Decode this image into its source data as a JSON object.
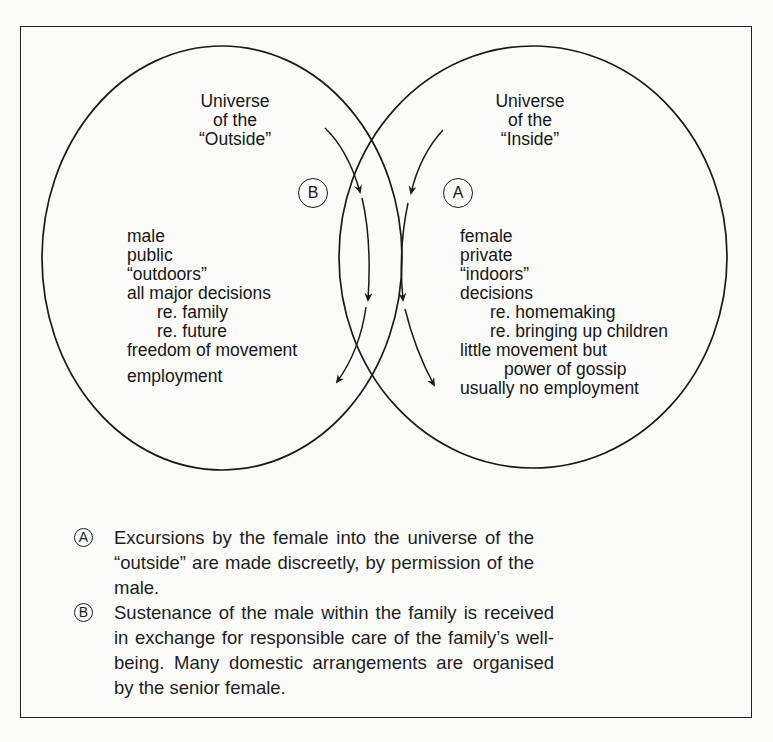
{
  "diagram": {
    "left_universe": {
      "title_lines": [
        "Universe",
        "of the",
        "“Outside”"
      ],
      "badge": "B",
      "items": [
        {
          "text": "male",
          "level": 0
        },
        {
          "text": "public",
          "level": 0
        },
        {
          "text": "“outdoors”",
          "level": 0
        },
        {
          "text": "all major decisions",
          "level": 0
        },
        {
          "text": "re. family",
          "level": 1
        },
        {
          "text": "re. future",
          "level": 1
        },
        {
          "text": "freedom of movement",
          "level": 0
        },
        {
          "text": "employment",
          "level": 0
        }
      ]
    },
    "right_universe": {
      "title_lines": [
        "Universe",
        "of the",
        "“Inside”"
      ],
      "badge": "A",
      "items": [
        {
          "text": "female",
          "level": 0
        },
        {
          "text": "private",
          "level": 0
        },
        {
          "text": "“indoors”",
          "level": 0
        },
        {
          "text": "decisions",
          "level": 0
        },
        {
          "text": "re. homemaking",
          "level": 1
        },
        {
          "text": "re. bringing up children",
          "level": 1
        },
        {
          "text": "little movement but",
          "level": 0
        },
        {
          "text": "power of gossip",
          "level": 2
        },
        {
          "text": "usually no employment",
          "level": 0
        }
      ]
    },
    "arrows": [
      {
        "id": "B-excursion",
        "direction": "from outside into inside, then back",
        "count": 2
      },
      {
        "id": "A-excursion",
        "direction": "from inside into outside, then back",
        "count": 2
      }
    ],
    "line_color": "#1a1a1a",
    "background": "#fbfbf9"
  },
  "legend": [
    {
      "marker": "A",
      "text": "Excursions by the female into the universe of the “outside” are made discreetly, by permission of the male."
    },
    {
      "marker": "B",
      "text": "Sustenance of the male within the family is received in exchange for responsible care of the family’s well-being. Many domestic arrangements are organised by the senior female."
    }
  ]
}
